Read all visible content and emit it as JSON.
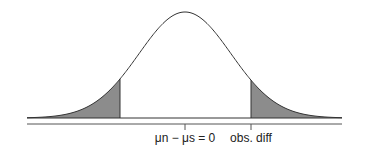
{
  "diagram": {
    "type": "normal-distribution-two-tailed",
    "center_label": "μn − μs = 0",
    "right_label": "obs. diff",
    "colors": {
      "curve": "#333333",
      "shade": "#8c8c8c",
      "axis": "#555555"
    }
  }
}
